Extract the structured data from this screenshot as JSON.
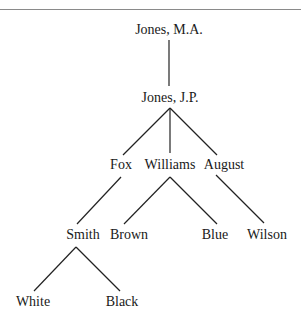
{
  "diagram": {
    "type": "tree",
    "nodes": [
      {
        "id": "n0",
        "label": "Jones, M.A.",
        "x": 169,
        "y": 30
      },
      {
        "id": "n1",
        "label": "Jones, J.P.",
        "x": 170,
        "y": 98
      },
      {
        "id": "n2",
        "label": "Fox",
        "x": 121,
        "y": 165
      },
      {
        "id": "n3",
        "label": "Williams",
        "x": 170,
        "y": 165
      },
      {
        "id": "n4",
        "label": "August",
        "x": 224,
        "y": 165
      },
      {
        "id": "n5",
        "label": "Smith",
        "x": 83,
        "y": 235
      },
      {
        "id": "n6",
        "label": "Brown",
        "x": 129,
        "y": 235
      },
      {
        "id": "n7",
        "label": "Blue",
        "x": 215,
        "y": 235
      },
      {
        "id": "n8",
        "label": "Wilson",
        "x": 267,
        "y": 235
      },
      {
        "id": "n9",
        "label": "White",
        "x": 33,
        "y": 302
      },
      {
        "id": "n10",
        "label": "Black",
        "x": 122,
        "y": 302
      }
    ],
    "edges": [
      {
        "from": "n0",
        "to": "n1",
        "x1": 169,
        "y1": 40,
        "x2": 169,
        "y2": 86
      },
      {
        "from": "n1",
        "to": "n2",
        "x1": 170,
        "y1": 108,
        "x2": 123,
        "y2": 155
      },
      {
        "from": "n1",
        "to": "n3",
        "x1": 170,
        "y1": 108,
        "x2": 170,
        "y2": 153
      },
      {
        "from": "n1",
        "to": "n4",
        "x1": 170,
        "y1": 108,
        "x2": 217,
        "y2": 155
      },
      {
        "from": "n2",
        "to": "n5",
        "x1": 121,
        "y1": 177,
        "x2": 77,
        "y2": 224
      },
      {
        "from": "n3",
        "to": "n6",
        "x1": 170,
        "y1": 177,
        "x2": 124,
        "y2": 224
      },
      {
        "from": "n3",
        "to": "n7",
        "x1": 170,
        "y1": 177,
        "x2": 217,
        "y2": 224
      },
      {
        "from": "n4",
        "to": "n8",
        "x1": 216,
        "y1": 175,
        "x2": 264,
        "y2": 223
      },
      {
        "from": "n5",
        "to": "n9",
        "x1": 76,
        "y1": 247,
        "x2": 34,
        "y2": 291
      },
      {
        "from": "n5",
        "to": "n10",
        "x1": 76,
        "y1": 247,
        "x2": 120,
        "y2": 291
      }
    ]
  }
}
